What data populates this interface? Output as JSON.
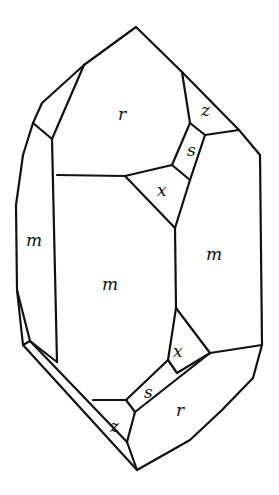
{
  "figure": {
    "colors": {
      "line": "#111111",
      "background": "#ffffff"
    },
    "face_labels": [
      {
        "id": "r-top",
        "text": "r",
        "x": 118,
        "y": 120
      },
      {
        "id": "z-top",
        "text": "z",
        "x": 201,
        "y": 116
      },
      {
        "id": "s-top",
        "text": "s",
        "x": 187,
        "y": 156
      },
      {
        "id": "x-top",
        "text": "x",
        "x": 157,
        "y": 196
      },
      {
        "id": "m-left",
        "text": "m",
        "x": 26,
        "y": 246
      },
      {
        "id": "m-center",
        "text": "m",
        "x": 102,
        "y": 290
      },
      {
        "id": "m-right",
        "text": "m",
        "x": 206,
        "y": 260
      },
      {
        "id": "x-bottom",
        "text": "x",
        "x": 173,
        "y": 357
      },
      {
        "id": "s-bottom",
        "text": "s",
        "x": 144,
        "y": 398
      },
      {
        "id": "r-bottom",
        "text": "r",
        "x": 176,
        "y": 416
      },
      {
        "id": "z-bottom",
        "text": "z",
        "x": 110,
        "y": 432
      }
    ]
  }
}
